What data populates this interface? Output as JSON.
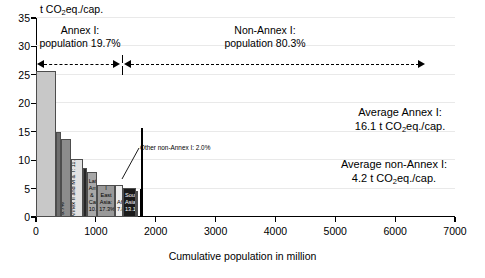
{
  "chart_data": {
    "type": "bar",
    "title": "",
    "ylabel": "t CO2eq./cap.",
    "ylabel_parts": {
      "pre": "t CO",
      "sub": "2",
      "post": "eq./cap."
    },
    "xlabel": "Cumulative population in million",
    "xlim": [
      0,
      7000
    ],
    "ylim": [
      0,
      35
    ],
    "yticks": [
      0,
      5,
      10,
      15,
      20,
      25,
      30,
      35
    ],
    "xticks": [
      0,
      1000,
      2000,
      3000,
      4000,
      5000,
      6000,
      7000
    ],
    "grid": true,
    "legend": "none",
    "x_is_cumulative_population": true,
    "bars": [
      {
        "name": "USA & Canada",
        "label": "USA & Canada: 19.4%",
        "share_pct": 19.4,
        "x_start": 0,
        "x_end": 332,
        "width_pop": 332,
        "value": 25.6,
        "color": "#c8c8c8",
        "label_orient": "vertical",
        "label_color": "dark"
      },
      {
        "name": "JANZ",
        "label": "JANZ: 5.2%",
        "share_pct": 5.2,
        "x_start": 332,
        "x_end": 421,
        "width_pop": 89,
        "value": 14.9,
        "color": "#6e6e6e",
        "label_orient": "vertical",
        "label_color": "light"
      },
      {
        "name": "EIT Annex I",
        "label": "EIT Annex I: 9.7%",
        "share_pct": 9.7,
        "x_start": 421,
        "x_end": 587,
        "width_pop": 166,
        "value": 13.7,
        "color": "#8c8c8c",
        "label_orient": "vertical",
        "label_color": "dark"
      },
      {
        "name": "Europe Annex II and M&T",
        "label": "Europe Annex II and M & T: 11.4%",
        "share_pct": 11.4,
        "x_start": 587,
        "x_end": 782,
        "width_pop": 195,
        "value": 10.2,
        "color": "#e2e2e2",
        "label_orient": "vertical",
        "label_color": "dark"
      },
      {
        "name": "Middle East",
        "label": "Middle East: 3.8%",
        "share_pct": 3.8,
        "x_start": 782,
        "x_end": 847,
        "width_pop": 65,
        "value": 8.7,
        "color": "#262626",
        "label_orient": "vertical",
        "label_color": "light"
      },
      {
        "name": "Latin America & Caribbean",
        "label": "Latin America & Caribbean: 10.3%",
        "share_pct": 10.3,
        "x_start": 847,
        "x_end": 1023,
        "width_pop": 176,
        "value": 7.9,
        "color": "#a8a8a8",
        "label_orient": "horizontal",
        "label_color": "dark"
      },
      {
        "name": "Non-Annex I East Asia",
        "label": "Non-Annex I East Asia: 17.3%",
        "share_pct": 17.3,
        "x_start": 1023,
        "x_end": 1319,
        "width_pop": 296,
        "value": 5.6,
        "color": "#999999",
        "label_orient": "horizontal",
        "label_color": "dark"
      },
      {
        "name": "Africa",
        "label": "Africa: 7.8%",
        "share_pct": 7.8,
        "x_start": 1319,
        "x_end": 1452,
        "width_pop": 133,
        "value": 5.6,
        "color": "#ededed",
        "label_orient": "horizontal",
        "label_color": "dark"
      },
      {
        "name": "South Asia",
        "label": "South Asia: 13.1%",
        "share_pct": 13.1,
        "x_start": 1452,
        "x_end": 1676,
        "width_pop": 224,
        "value": 5.1,
        "color": "#1a1a1a",
        "label_orient": "horizontal",
        "label_color": "light"
      },
      {
        "name": "Other non-Annex I",
        "label": "Other non-Annex I: 2.0%",
        "share_pct": 2.0,
        "x_start": 1676,
        "x_end": 1710,
        "width_pop": 34,
        "value": 4.6,
        "color": "#1a1a1a",
        "label_orient": "callout",
        "label_color": "dark"
      },
      {
        "name": "Right bar 1",
        "label": "",
        "share_pct": 0,
        "x_start": 1730,
        "x_end": 1752,
        "width_pop": 22,
        "value": 5.0,
        "color": "#000000",
        "label_orient": "none",
        "label_color": "dark"
      },
      {
        "name": "Right bar 2",
        "label": "",
        "share_pct": 0,
        "x_start": 1760,
        "x_end": 1784,
        "width_pop": 24,
        "value": 15.6,
        "color": "#000000",
        "label_orient": "none",
        "label_color": "dark"
      }
    ],
    "annotations": [
      {
        "id": "annex-header",
        "text_line1": "Annex I:",
        "text_line2": "population 19.7%"
      },
      {
        "id": "nonannex-header",
        "text_line1": "Non-Annex I:",
        "text_line2": "population 80.3%"
      },
      {
        "id": "avg-annex",
        "text_line1": "Average Annex I:",
        "text_line2_pre": "16.1 t CO",
        "text_line2_sub": "2",
        "text_line2_post": "eq./cap.",
        "value": 16.1
      },
      {
        "id": "avg-nonannex",
        "text_line1": "Average non-Annex I:",
        "text_line2_pre": "4.2 t CO",
        "text_line2_sub": "2",
        "text_line2_post": "eq./cap.",
        "value": 4.2
      },
      {
        "id": "callout",
        "text": "Other non-Annex I: 2.0%"
      }
    ]
  },
  "axes": {
    "ylabel_pre": "t CO",
    "ylabel_sub": "2",
    "ylabel_post": "eq./cap.",
    "xlabel": "Cumulative population in million"
  },
  "headers": {
    "annex": {
      "line1": "Annex I:",
      "line2": "population 19.7%"
    },
    "nonannex": {
      "line1": "Non-Annex I:",
      "line2": "population 80.3%"
    }
  },
  "averages": {
    "annex": {
      "line1": "Average Annex I:",
      "pre": "16.1 t CO",
      "sub": "2",
      "post": "eq./cap."
    },
    "nonannex": {
      "line1": "Average non-Annex I:",
      "pre": "4.2 t CO",
      "sub": "2",
      "post": "eq./cap."
    }
  },
  "callout": {
    "text": "Other non-Annex I: 2.0%"
  },
  "colors": {
    "axis": "#000000",
    "grid": "#e9e9e9",
    "background": "#ffffff"
  }
}
